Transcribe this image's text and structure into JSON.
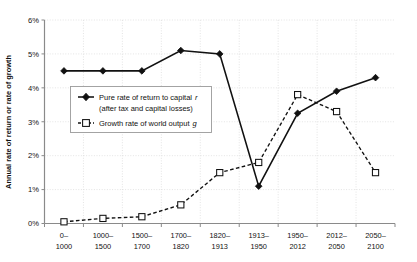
{
  "chart_data": {
    "type": "line",
    "title": "",
    "xlabel": "",
    "ylabel": "Annual rate of return or rate of growth",
    "ylim": [
      0,
      6
    ],
    "ytick_labels": [
      "0%",
      "1%",
      "2%",
      "3%",
      "4%",
      "5%",
      "6%"
    ],
    "ytick_values": [
      0,
      1,
      2,
      3,
      4,
      5,
      6
    ],
    "grid": true,
    "legend_position": "inside-upper-left",
    "categories": [
      "0–\n1000",
      "1000–\n1500",
      "1500–\n1700",
      "1700–\n1820",
      "1820–\n1913",
      "1913–\n1950",
      "1950–\n2012",
      "2012–\n2050",
      "2050–\n2100"
    ],
    "category_lines": [
      [
        "0–",
        "1000"
      ],
      [
        "1000–",
        "1500"
      ],
      [
        "1500–",
        "1700"
      ],
      [
        "1700–",
        "1820"
      ],
      [
        "1820–",
        "1913"
      ],
      [
        "1913–",
        "1950"
      ],
      [
        "1950–",
        "2012"
      ],
      [
        "2012–",
        "2050"
      ],
      [
        "2050–",
        "2100"
      ]
    ],
    "series": [
      {
        "name": "Pure rate of return to capital r (after tax and capital losses)",
        "key": "r",
        "style": "solid",
        "marker": "filled-diamond",
        "values": [
          4.5,
          4.5,
          4.5,
          5.1,
          5.0,
          1.1,
          3.25,
          3.9,
          4.3
        ]
      },
      {
        "name": "Growth rate of world output g",
        "key": "g",
        "style": "dashed",
        "marker": "open-square",
        "values": [
          0.05,
          0.15,
          0.2,
          0.55,
          1.5,
          1.8,
          3.8,
          3.3,
          1.5
        ]
      }
    ]
  },
  "legend": {
    "entry_r_line1": "Pure rate of return to capital",
    "entry_r_symbol": "r",
    "entry_r_line2": "(after tax and capital losses)",
    "entry_g_line1": "Growth rate of world output",
    "entry_g_symbol": "g"
  },
  "colors": {
    "series_r": "#111111",
    "series_g": "#111111",
    "grid": "#d8d8d8",
    "axis": "#8a8a8a",
    "background": "#ffffff"
  }
}
